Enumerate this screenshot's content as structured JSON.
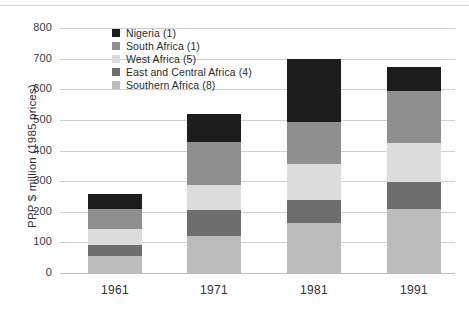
{
  "chart_data": {
    "type": "bar",
    "stacked": true,
    "title": "",
    "xlabel": "",
    "ylabel": "PPP $ million (1985 prices)",
    "categories": [
      "1961",
      "1971",
      "1981",
      "1991"
    ],
    "ylim": [
      0,
      800
    ],
    "yticks": [
      0,
      100,
      200,
      300,
      400,
      500,
      600,
      700,
      800
    ],
    "grid": true,
    "legend_position": "top-left-inside",
    "series": [
      {
        "name": "Nigeria (1)",
        "color": "#1c1c1c",
        "values": [
          50,
          92,
          208,
          78
        ]
      },
      {
        "name": "South Africa (1)",
        "color": "#8f8f8f",
        "values": [
          65,
          140,
          137,
          170
        ]
      },
      {
        "name": "West Africa (5)",
        "color": "#dcdcdc",
        "values": [
          51,
          83,
          115,
          127
        ]
      },
      {
        "name": "East and Central Africa (4)",
        "color": "#6e6e6e",
        "values": [
          37,
          85,
          77,
          88
        ]
      },
      {
        "name": "Southern Africa (8)",
        "color": "#bcbcbc",
        "values": [
          55,
          120,
          163,
          210
        ]
      }
    ],
    "stack_order_bottom_to_top": [
      "Southern Africa (8)",
      "East and Central Africa (4)",
      "West Africa (5)",
      "South Africa (1)",
      "Nigeria (1)"
    ],
    "totals": [
      258,
      520,
      700,
      673
    ],
    "cumulative_tops": {
      "1961": {
        "Southern Africa (8)": 55,
        "East and Central Africa (4)": 92,
        "West Africa (5)": 143,
        "South Africa (1)": 208,
        "Nigeria (1)": 258
      },
      "1971": {
        "Southern Africa (8)": 120,
        "East and Central Africa (4)": 205,
        "West Africa (5)": 288,
        "South Africa (1)": 428,
        "Nigeria (1)": 520
      },
      "1981": {
        "Southern Africa (8)": 163,
        "East and Central Africa (4)": 240,
        "West Africa (5)": 355,
        "South Africa (1)": 492,
        "Nigeria (1)": 700
      },
      "1991": {
        "Southern Africa (8)": 210,
        "East and Central Africa (4)": 298,
        "West Africa (5)": 425,
        "South Africa (1)": 595,
        "Nigeria (1)": 673
      }
    }
  },
  "axis": {
    "y_title": "PPP $ million (1985 prices)",
    "y_labels": [
      "800",
      "700",
      "600",
      "500",
      "400",
      "300",
      "200",
      "100",
      "0"
    ],
    "x_labels": [
      "1961",
      "1971",
      "1981",
      "1991"
    ]
  },
  "legend": {
    "items": [
      {
        "label": "Nigeria (1)",
        "color": "#1c1c1c"
      },
      {
        "label": "South Africa (1)",
        "color": "#8f8f8f"
      },
      {
        "label": "West Africa (5)",
        "color": "#dcdcdc"
      },
      {
        "label": "East and Central Africa (4)",
        "color": "#6e6e6e"
      },
      {
        "label": "Southern Africa (8)",
        "color": "#bcbcbc"
      }
    ]
  },
  "style": {
    "background": "#ffffff",
    "gridline_color": "#cfcfcf",
    "text_color": "#2f2f2f"
  }
}
